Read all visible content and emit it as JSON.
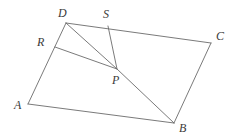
{
  "figure": {
    "stroke_color": "#6b6b6b",
    "label_color": "#3a3a3a",
    "background_color": "#ffffff",
    "stroke_width": 0.9,
    "width": 238,
    "height": 138
  },
  "points": {
    "A": {
      "label": "A",
      "x": 28,
      "y": 104,
      "label_x": 14,
      "label_y": 99
    },
    "B": {
      "label": "B",
      "x": 174,
      "y": 123,
      "label_x": 179,
      "label_y": 122
    },
    "C": {
      "label": "C",
      "x": 211,
      "y": 43,
      "label_x": 216,
      "label_y": 30
    },
    "D": {
      "label": "D",
      "x": 66,
      "y": 23,
      "label_x": 58,
      "label_y": 7
    },
    "P": {
      "label": "P",
      "x": 117,
      "y": 69,
      "label_x": 112,
      "label_y": 74
    },
    "R": {
      "label": "R",
      "x": 55,
      "y": 47,
      "label_x": 37,
      "label_y": 36
    },
    "S": {
      "label": "S",
      "x": 108,
      "y": 26,
      "label_x": 103,
      "label_y": 8
    }
  },
  "segments": [
    {
      "name": "side-AB",
      "from": "A",
      "to": "B"
    },
    {
      "name": "side-BC",
      "from": "B",
      "to": "C"
    },
    {
      "name": "side-CD",
      "from": "C",
      "to": "D"
    },
    {
      "name": "side-DA",
      "from": "D",
      "to": "A"
    },
    {
      "name": "cevian-DP",
      "from": "D",
      "to": "P"
    },
    {
      "name": "cevian-SP",
      "from": "S",
      "to": "P"
    },
    {
      "name": "cevian-RP",
      "from": "R",
      "to": "P"
    },
    {
      "name": "cevian-PB",
      "from": "P",
      "to": "B"
    }
  ]
}
